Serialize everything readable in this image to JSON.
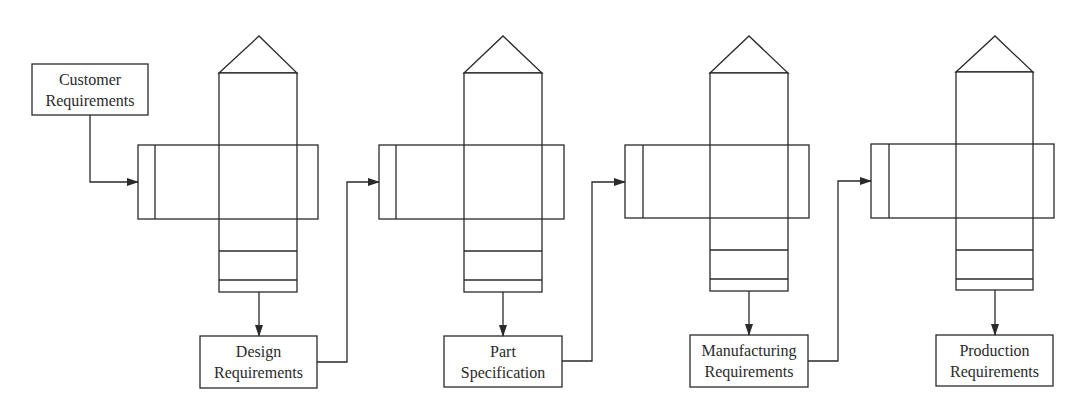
{
  "diagram": {
    "type": "QFD house-of-quality cascade",
    "nodes": [
      {
        "id": "customer",
        "line1": "Customer",
        "line2": "Requirements"
      },
      {
        "id": "design",
        "line1": "Design",
        "line2": "Requirements"
      },
      {
        "id": "part",
        "line1": "Part",
        "line2": "Specification"
      },
      {
        "id": "manufacturing",
        "line1": "Manufacturing",
        "line2": "Requirements"
      },
      {
        "id": "production",
        "line1": "Production",
        "line2": "Requirements"
      }
    ],
    "houses": [
      {
        "id": "house-1",
        "input": "Customer Requirements",
        "output": "Design Requirements"
      },
      {
        "id": "house-2",
        "input": "Design Requirements",
        "output": "Part Specification"
      },
      {
        "id": "house-3",
        "input": "Part Specification",
        "output": "Manufacturing Requirements"
      },
      {
        "id": "house-4",
        "input": "Manufacturing Requirements",
        "output": "Production Requirements"
      }
    ],
    "colors": {
      "line": "#2a2a2a",
      "background": "#ffffff"
    }
  }
}
